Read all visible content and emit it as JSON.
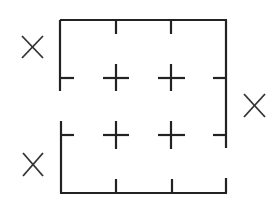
{
  "diagram": {
    "type": "grid-maze",
    "stroke_color": "#222222",
    "background": "#ffffff",
    "frame": {
      "left": 61,
      "top": 20,
      "right": 226,
      "bottom": 193
    },
    "columns_x": [
      61,
      116,
      171,
      226
    ],
    "rows_y": [
      20,
      78,
      135,
      193
    ],
    "x_marks": [
      {
        "label": "X",
        "position": "left-upper",
        "cx": 32,
        "cy": 47
      },
      {
        "label": "X",
        "position": "right-middle",
        "cx": 254,
        "cy": 106
      },
      {
        "label": "X",
        "position": "left-lower",
        "cx": 33,
        "cy": 165
      }
    ],
    "interior_crosses": [
      {
        "cx": 116,
        "cy": 78
      },
      {
        "cx": 171,
        "cy": 78
      },
      {
        "cx": 116,
        "cy": 135
      },
      {
        "cx": 171,
        "cy": 135
      }
    ]
  }
}
